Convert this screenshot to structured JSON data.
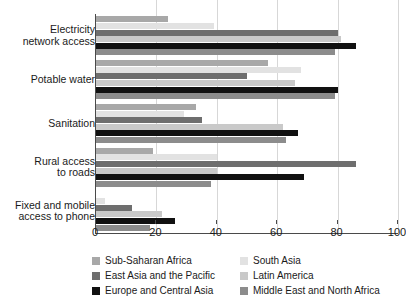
{
  "chart_data": {
    "type": "bar",
    "orientation": "horizontal",
    "title": "",
    "subtitle": "",
    "xlabel": "",
    "ylabel": "",
    "xlim": [
      0,
      100
    ],
    "xticks": [
      "0",
      "20",
      "40",
      "60",
      "80",
      "100"
    ],
    "xtick_values": [
      0,
      20,
      40,
      60,
      80,
      100
    ],
    "grid": "vertical",
    "legend_position": "bottom",
    "categories": [
      "Electricity\nnetwork access",
      "Potable water",
      "Sanitation",
      "Rural access\nto roads",
      "Fixed and mobile\naccess to phone"
    ],
    "series": [
      {
        "name": "Sub-Saharan Africa",
        "color": "#a8a8a8",
        "values": [
          24,
          57,
          33,
          19,
          0
        ]
      },
      {
        "name": "South Asia",
        "color": "#e2e2e2",
        "values": [
          39,
          68,
          29,
          40,
          3
        ]
      },
      {
        "name": "East Asia and the Pacific",
        "color": "#6e6e6e",
        "values": [
          80,
          50,
          35,
          86,
          12
        ]
      },
      {
        "name": "Latin America",
        "color": "#c9c9c9",
        "values": [
          81,
          66,
          62,
          40,
          22
        ]
      },
      {
        "name": "Europe and Central Asia",
        "color": "#111111",
        "values": [
          86,
          80,
          67,
          69,
          26
        ]
      },
      {
        "name": "Middle East and North Africa",
        "color": "#8c8c8c",
        "values": [
          79,
          79,
          63,
          38,
          18
        ]
      }
    ]
  },
  "legend": {
    "entries": [
      {
        "label": "Sub-Saharan Africa",
        "color": "#a8a8a8"
      },
      {
        "label": "South Asia",
        "color": "#e2e2e2"
      },
      {
        "label": "East Asia and the Pacific",
        "color": "#6e6e6e"
      },
      {
        "label": "Latin America",
        "color": "#c9c9c9"
      },
      {
        "label": "Europe and Central Asia",
        "color": "#111111"
      },
      {
        "label": "Middle East and North Africa",
        "color": "#8c8c8c"
      }
    ]
  }
}
